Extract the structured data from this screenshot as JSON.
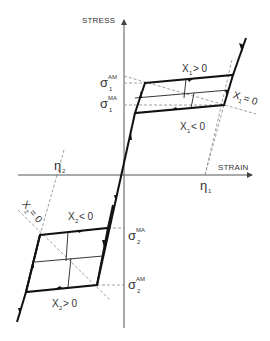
{
  "diagram": {
    "axes": {
      "y_label": "STRESS",
      "x_label": "STRAIN"
    },
    "stress_levels": {
      "sigma1_AM": {
        "base": "σ",
        "sub": "1",
        "sup": "AM"
      },
      "sigma1_MA": {
        "base": "σ",
        "sub": "1",
        "sup": "MA"
      },
      "sigma2_MA": {
        "base": "σ",
        "sub": "2",
        "sup": "MA"
      },
      "sigma2_AM": {
        "base": "σ",
        "sub": "2",
        "sup": "AM"
      }
    },
    "strain_levels": {
      "eta1": {
        "base": "η",
        "sub": "1"
      },
      "eta2": {
        "base": "η",
        "sub": "2"
      }
    },
    "regions": {
      "x1_pos": {
        "base": "X",
        "sub": "1",
        "rel": "> 0"
      },
      "x1_neg": {
        "base": "X",
        "sub": "1",
        "rel": "< 0"
      },
      "x1_zero": {
        "base": "X",
        "sub": "1",
        "rel": "= 0"
      },
      "x2_neg": {
        "base": "X",
        "sub": "2",
        "rel": "< 0"
      },
      "x2_pos": {
        "base": "X",
        "sub": "2",
        "rel": "> 0"
      },
      "x2_zero": {
        "base": "X",
        "sub": "2",
        "rel": "= 0"
      }
    },
    "colors": {
      "line": "#1a1a1a",
      "axis": "#555555",
      "dashed": "#888888"
    }
  }
}
